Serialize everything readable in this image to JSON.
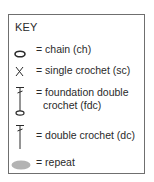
{
  "key": {
    "title": "KEY",
    "items": [
      {
        "symbol": "chain-icon",
        "label": "= chain (ch)"
      },
      {
        "symbol": "single-crochet-icon",
        "glyph": "X",
        "label": "= single crochet (sc)"
      },
      {
        "symbol": "foundation-double-crochet-icon",
        "label_line1": "= foundation double",
        "label_line2": "crochet (fdc)"
      },
      {
        "symbol": "double-crochet-icon",
        "label": "= double crochet (dc)"
      },
      {
        "symbol": "repeat-icon",
        "label": "= repeat"
      }
    ]
  },
  "colors": {
    "border": "#6f6f6f",
    "text": "#2a2a2a",
    "repeat_fill": "#b3b3b3"
  }
}
